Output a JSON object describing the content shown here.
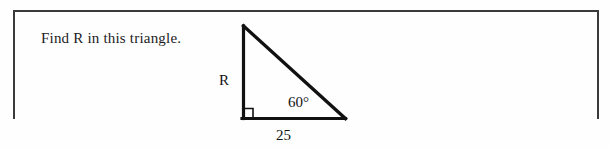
{
  "document": {
    "background_color": "#fefefe",
    "border_color": "#3a3a3a",
    "ink_color": "#131313"
  },
  "problem": {
    "prompt": "Find R in this triangle."
  },
  "figure": {
    "name": "right-triangle",
    "stroke_color": "#111111",
    "labels": {
      "unknown_side": "R",
      "angle": "60°",
      "base": "25"
    },
    "vertices": {
      "apex": [
        243,
        26
      ],
      "right_angle": [
        243,
        118
      ],
      "base_right": [
        345,
        118
      ]
    },
    "right_angle_marker": "square"
  }
}
